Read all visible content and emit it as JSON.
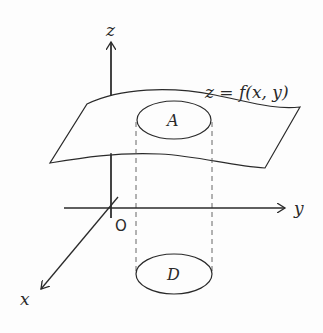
{
  "diagram": {
    "type": "3d-surface-projection",
    "axes": {
      "z_label": "z",
      "y_label": "y",
      "x_label": "x",
      "origin_label": "O"
    },
    "surface": {
      "equation_label": "z = f(x, y)"
    },
    "regions": {
      "upper_label": "A",
      "lower_label": "D"
    },
    "colors": {
      "stroke": "#2a2a2a",
      "background": "#fdfdfd"
    }
  }
}
